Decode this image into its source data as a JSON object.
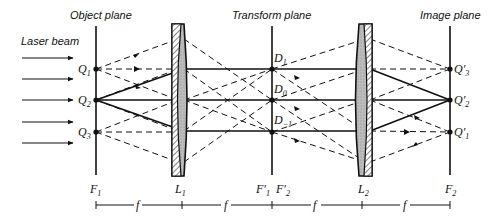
{
  "titles": {
    "object_plane": "Object plane",
    "transform_plane": "Transform plane",
    "image_plane": "Image plane",
    "laser_beam": "Laser beam"
  },
  "object_points": [
    {
      "label": "Q",
      "sub": "1"
    },
    {
      "label": "Q",
      "sub": "2"
    },
    {
      "label": "Q",
      "sub": "3"
    }
  ],
  "transform_points": [
    {
      "label": "D",
      "sub": "1"
    },
    {
      "label": "D",
      "sub": "0"
    },
    {
      "label": "D",
      "sub": "−1"
    }
  ],
  "image_points": [
    {
      "label": "Q′",
      "sub": "3"
    },
    {
      "label": "Q′",
      "sub": "2"
    },
    {
      "label": "Q′",
      "sub": "1"
    }
  ],
  "bottom_labels": {
    "f1": {
      "label": "F",
      "sub": "1"
    },
    "l1": {
      "label": "L",
      "sub": "1"
    },
    "f1p": {
      "label": "F′",
      "sub": "1"
    },
    "f2p": {
      "label": "F′",
      "sub": "2"
    },
    "l2": {
      "label": "L",
      "sub": "2"
    },
    "f2": {
      "label": "F",
      "sub": "2"
    }
  },
  "scale": {
    "segments": [
      "f",
      "f",
      "f",
      "f"
    ]
  },
  "colors": {
    "ink": "#111111",
    "lens_fill": "#c8c8c8"
  }
}
